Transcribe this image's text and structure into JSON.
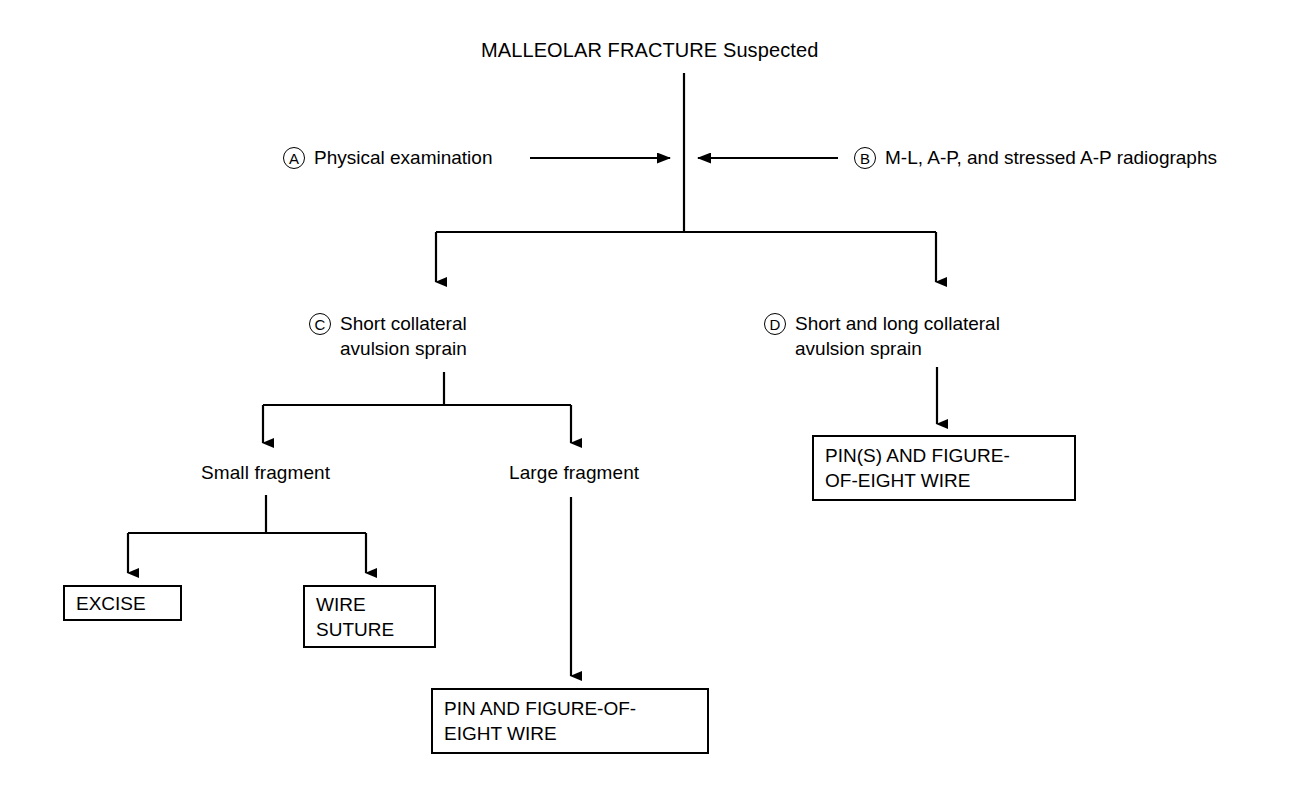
{
  "diagram": {
    "type": "clinical-decision-flowchart",
    "title": "MALLEOLAR FRACTURE Suspected",
    "stroke_color": "#000000",
    "background_color": "#ffffff",
    "steps": [
      {
        "badge": "A",
        "label": "Physical examination"
      },
      {
        "badge": "B",
        "label": "M-L, A-P, and stressed A-P radiographs"
      },
      {
        "badge": "C",
        "label": "Short collateral\navulsion sprain"
      },
      {
        "badge": "D",
        "label": "Short and long collateral\navulsion sprain"
      }
    ],
    "branches": [
      {
        "label": "Small fragment"
      },
      {
        "label": "Large fragment"
      }
    ],
    "treatments": [
      {
        "label": "EXCISE"
      },
      {
        "label": "WIRE\nSUTURE"
      },
      {
        "label": "PIN AND FIGURE-OF-\nEIGHT WIRE"
      },
      {
        "label": "PIN(S) AND FIGURE-\nOF-EIGHT WIRE"
      }
    ]
  }
}
